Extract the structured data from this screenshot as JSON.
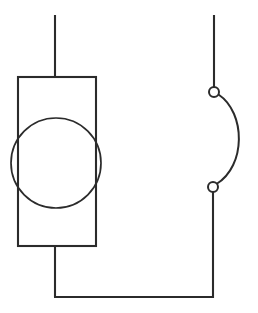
{
  "diagram": {
    "canvas": {
      "width": 258,
      "height": 313,
      "background": "#ffffff"
    },
    "style": {
      "stroke_color": "#2b2b2b",
      "terminal_fill": "#ffffff",
      "stroke_width": 2.1,
      "thin_stroke_width": 1.7
    },
    "components": [
      {
        "name": "source-block",
        "type": "rectangle",
        "label": "",
        "x": 18,
        "y": 77,
        "width": 78,
        "height": 169
      },
      {
        "name": "source-circle",
        "type": "circle",
        "label": "",
        "cx": 56,
        "cy": 163,
        "r": 45
      },
      {
        "name": "top-lead",
        "type": "line",
        "x1": 55,
        "y1": 15,
        "x2": 55,
        "y2": 77
      },
      {
        "name": "bottom-lead",
        "type": "line",
        "x1": 55,
        "y1": 246,
        "x2": 55,
        "y2": 297
      },
      {
        "name": "return-wire",
        "type": "line",
        "x1": 55,
        "y1": 297,
        "x2": 213,
        "y2": 297
      },
      {
        "name": "switch-upper-lead",
        "type": "line",
        "x1": 214,
        "y1": 15,
        "x2": 214,
        "y2": 87
      },
      {
        "name": "switch-lower-lead",
        "type": "line",
        "x1": 213,
        "y1": 192,
        "x2": 213,
        "y2": 297
      },
      {
        "name": "switch-terminal-upper",
        "type": "circle",
        "cx": 214,
        "cy": 92,
        "r": 5
      },
      {
        "name": "switch-terminal-lower",
        "type": "circle",
        "cx": 213,
        "cy": 187,
        "r": 5
      },
      {
        "name": "switch-blade-arc",
        "type": "arc",
        "start": [
          218,
          95
        ],
        "end": [
          217,
          184
        ],
        "control1": [
          246,
          112
        ],
        "control2": [
          246,
          167
        ],
        "bulge_direction": "right",
        "rightmost_x": 243
      }
    ]
  }
}
